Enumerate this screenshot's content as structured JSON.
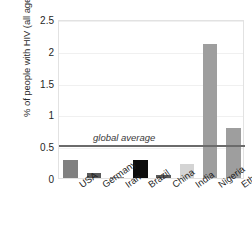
{
  "chart_data": {
    "type": "bar",
    "title": "",
    "xlabel": "",
    "ylabel": "% of people with HIV (all ages)",
    "ylim": [
      0,
      2.5
    ],
    "grid": true,
    "legend": "none",
    "categories": [
      "USA",
      "Germany",
      "Iran",
      "Brazil",
      "China",
      "India",
      "Nigeria",
      "Ethiopia"
    ],
    "values": [
      0.28,
      0.08,
      0.02,
      0.28,
      0.05,
      0.22,
      2.1,
      0.78
    ],
    "bar_colors": [
      "#808080",
      "#595959",
      "#8c8c8c",
      "#0d0d0d",
      "#595959",
      "#d4d4d4",
      "#9e9e9e",
      "#9e9e9e"
    ],
    "yticks": [
      0,
      0.5,
      1,
      1.5,
      2,
      2.5
    ],
    "ytick_labels": [
      "0",
      "0.5",
      "1",
      "1.5",
      "2",
      "2.5"
    ],
    "annotations": [
      {
        "label": "global average",
        "value": 0.53,
        "type": "hline",
        "color": "#6b6b6b"
      }
    ]
  },
  "axis": {
    "y_title": "% of people with HIV (all ages)"
  }
}
